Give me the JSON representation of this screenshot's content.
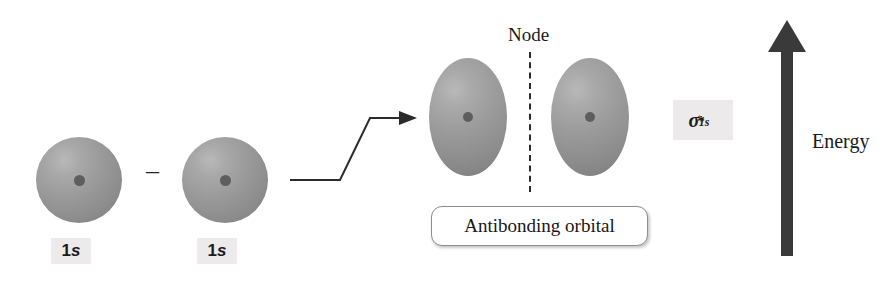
{
  "diagram": {
    "background_color": "#ffffff",
    "orbital_color": "#9b9b9b",
    "nucleus_color": "#5e5e5e",
    "arrow_color": "#3a3a3a",
    "chip_background": "#eceaea"
  },
  "atomic_orbitals": [
    {
      "label_1": "1",
      "label_s": "s",
      "name": "1s"
    },
    {
      "label_1": "1",
      "label_s": "s",
      "name": "1s"
    }
  ],
  "operator": {
    "symbol": "–",
    "name": "minus"
  },
  "transform_arrow": {
    "name": "leads-to",
    "direction": "right"
  },
  "molecular_orbital": {
    "node_label": "Node",
    "caption": "Antibonding orbital",
    "symbol": {
      "sigma": "σ",
      "superscript": "*",
      "subscript": "1s"
    }
  },
  "energy_axis": {
    "label": "Energy",
    "direction": "up"
  }
}
